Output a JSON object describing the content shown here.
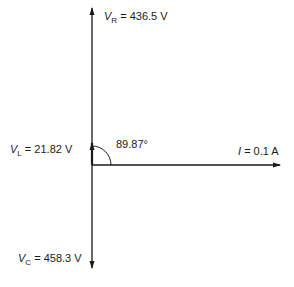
{
  "diagram": {
    "type": "phasor-diagram",
    "angle_label": "89.87°",
    "phasors": [
      {
        "id": "VR",
        "symbol": "V",
        "subscript": "R",
        "value": "= 436.5 V",
        "direction": "up"
      },
      {
        "id": "VL",
        "symbol": "V",
        "subscript": "L",
        "value": "= 21.82 V",
        "direction": "up-short"
      },
      {
        "id": "VC",
        "symbol": "V",
        "subscript": "C",
        "value": "= 458.3 V",
        "direction": "down"
      },
      {
        "id": "I",
        "symbol": "I",
        "subscript": "",
        "value": "= 0.1 A",
        "direction": "right"
      }
    ],
    "colors": {
      "line": "#1a1a1a",
      "background": "#ffffff"
    }
  }
}
